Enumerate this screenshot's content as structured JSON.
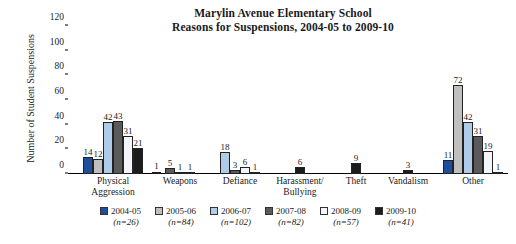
{
  "chart_data": {
    "type": "bar",
    "title": "Marylin Avenue Elementary School",
    "subtitle": "Reasons for Suspensions, 2004-05 to 2009-10",
    "xlabel": "",
    "ylabel": "Number of Student Suspensions",
    "ylim": [
      0,
      120
    ],
    "yticks": [
      0,
      20,
      40,
      60,
      80,
      100,
      120
    ],
    "grid": false,
    "legend_position": "bottom",
    "categories": [
      "Physical Aggression",
      "Weapons",
      "Defiance",
      "Harassment/ Bullying",
      "Theft",
      "Vandalism",
      "Other"
    ],
    "series": [
      {
        "name": "2004-05",
        "n_label": "(n=26)",
        "color": "#1f4e9c",
        "values": [
          14,
          0,
          0,
          0,
          0,
          0,
          11
        ]
      },
      {
        "name": "2005-06",
        "n_label": "(n=84)",
        "color": "#bfbfbf",
        "values": [
          12,
          0,
          0,
          0,
          0,
          0,
          72
        ]
      },
      {
        "name": "2006-07",
        "n_label": "(n=102)",
        "color": "#aecbe8",
        "values": [
          42,
          0,
          18,
          0,
          0,
          0,
          42
        ]
      },
      {
        "name": "2007-08",
        "n_label": "(n=82)",
        "color": "#5a5a5a",
        "values": [
          43,
          5,
          3,
          0,
          0,
          0,
          31
        ]
      },
      {
        "name": "2008-09",
        "n_label": "(n=57)",
        "color": "#f2f6fb",
        "values": [
          31,
          1,
          6,
          0,
          0,
          0,
          19
        ]
      },
      {
        "name": "2009-10",
        "n_label": "(n=41)",
        "color": "#1c1c1c",
        "values": [
          21,
          1,
          1,
          6,
          9,
          3,
          1
        ]
      }
    ],
    "weapons_leading_value": 1
  },
  "legend": {
    "items": [
      {
        "label": "2004-05",
        "n": "(n=26)"
      },
      {
        "label": "2005-06",
        "n": "(n=84)"
      },
      {
        "label": "2006-07",
        "n": "(n=102)"
      },
      {
        "label": "2007-08",
        "n": "(n=82)"
      },
      {
        "label": "2008-09",
        "n": "(n=57)"
      },
      {
        "label": "2009-10",
        "n": "(n=41)"
      }
    ]
  }
}
